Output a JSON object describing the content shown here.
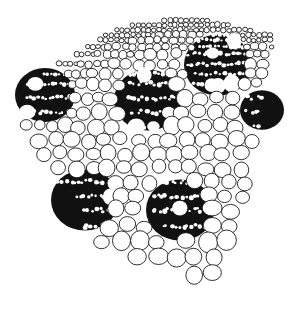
{
  "figure": {
    "caption": "",
    "colors": {
      "line": "#1a1a1a",
      "bundle_fill": "#111111",
      "background": "#ffffff"
    },
    "regions": [
      {
        "name": "epidermis-band",
        "description": "Rows of small cells along top edge"
      },
      {
        "name": "vascular-bundle-1",
        "cx": 45,
        "cy": 95
      },
      {
        "name": "vascular-bundle-2",
        "cx": 148,
        "cy": 100
      },
      {
        "name": "vascular-bundle-3",
        "cx": 218,
        "cy": 65
      },
      {
        "name": "vascular-bundle-4",
        "cx": 262,
        "cy": 110
      },
      {
        "name": "vascular-bundle-5",
        "cx": 85,
        "cy": 200
      },
      {
        "name": "vascular-bundle-6",
        "cx": 180,
        "cy": 210
      },
      {
        "name": "parenchyma",
        "description": "Large rounded ground tissue cells"
      }
    ]
  }
}
